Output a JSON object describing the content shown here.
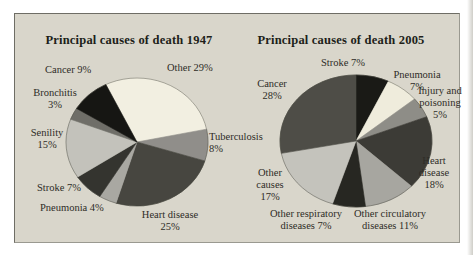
{
  "figure": {
    "background_color": "#d9d6cb"
  },
  "chart_data": [
    {
      "type": "pie",
      "title": "Principal causes of death 1947",
      "units": "percent",
      "start_angle_deg": -26,
      "label_position": "outside",
      "slices": [
        {
          "name": "Other",
          "pct": 29,
          "color": "#f2efe1",
          "label_lines": [
            "Other 29%"
          ]
        },
        {
          "name": "Tuberculosis",
          "pct": 8,
          "color": "#908e8a",
          "label_lines": [
            "Tuberculosis",
            "8%"
          ]
        },
        {
          "name": "Heart disease",
          "pct": 25,
          "color": "#474640",
          "label_lines": [
            "Heart disease",
            "25%"
          ]
        },
        {
          "name": "Pneumonia",
          "pct": 4,
          "color": "#a9a8a2",
          "label_lines": [
            "Pneumonia 4%"
          ]
        },
        {
          "name": "Stroke",
          "pct": 7,
          "color": "#34342f",
          "label_lines": [
            "Stroke 7%"
          ]
        },
        {
          "name": "Senility",
          "pct": 15,
          "color": "#c3c2bb",
          "label_lines": [
            "Senility",
            "15%"
          ]
        },
        {
          "name": "Bronchitis",
          "pct": 3,
          "color": "#6f6e68",
          "label_lines": [
            "Bronchitis",
            "3%"
          ]
        },
        {
          "name": "Cancer",
          "pct": 9,
          "color": "#161613",
          "label_lines": [
            "Cancer 9%"
          ]
        }
      ]
    },
    {
      "type": "pie",
      "title": "Principal causes of death 2005",
      "units": "percent",
      "start_angle_deg": 0,
      "label_position": "outside",
      "slices": [
        {
          "name": "Stroke",
          "pct": 7,
          "color": "#1a1a16",
          "label_lines": [
            "Stroke 7%"
          ]
        },
        {
          "name": "Pneumonia",
          "pct": 7,
          "color": "#efecdc",
          "label_lines": [
            "Pneumonia",
            "7%"
          ]
        },
        {
          "name": "Injury and poisoning",
          "pct": 5,
          "color": "#8e8d87",
          "label_lines": [
            "Injury and",
            "poisoning",
            "5%"
          ]
        },
        {
          "name": "Heart disease",
          "pct": 18,
          "color": "#3c3b36",
          "label_lines": [
            "Heart",
            "disease",
            "18%"
          ]
        },
        {
          "name": "Other circulatory diseases",
          "pct": 11,
          "color": "#a7a6a0",
          "label_lines": [
            "Other circulatory",
            "diseases 11%"
          ]
        },
        {
          "name": "Other respiratory diseases",
          "pct": 7,
          "color": "#272722",
          "label_lines": [
            "Other respiratory",
            "diseases 7%"
          ]
        },
        {
          "name": "Other causes",
          "pct": 17,
          "color": "#c4c3bc",
          "label_lines": [
            "Other",
            "causes",
            "17%"
          ]
        },
        {
          "name": "Cancer",
          "pct": 28,
          "color": "#4e4d47",
          "label_lines": [
            "Cancer",
            "28%"
          ]
        }
      ]
    }
  ]
}
